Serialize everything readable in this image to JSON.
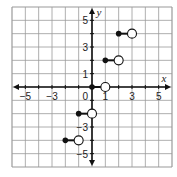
{
  "chart_data": {
    "type": "scatter",
    "title": "",
    "xlabel": "x",
    "ylabel": "y",
    "xlim": [
      -6,
      6
    ],
    "ylim": [
      -6,
      6
    ],
    "grid": true,
    "x_tick_labels": [
      {
        "value": -5,
        "label": "−5"
      },
      {
        "value": -3,
        "label": "−3"
      },
      {
        "value": 1,
        "label": "1"
      },
      {
        "value": 3,
        "label": "3"
      },
      {
        "value": 5,
        "label": "5"
      }
    ],
    "y_tick_labels": [
      {
        "value": 5,
        "label": "5"
      },
      {
        "value": 3,
        "label": "3"
      },
      {
        "value": 1,
        "label": "1"
      },
      {
        "value": -3,
        "label": "−3"
      },
      {
        "value": -5,
        "label": "−5"
      }
    ],
    "origin_label": "0",
    "segments": [
      {
        "closed": [
          2,
          4
        ],
        "open": [
          3,
          4
        ]
      },
      {
        "closed": [
          1,
          2
        ],
        "open": [
          2,
          2
        ]
      },
      {
        "closed": [
          0,
          0
        ],
        "open": [
          1,
          0
        ]
      },
      {
        "closed": [
          -1,
          -2
        ],
        "open": [
          0,
          -2
        ]
      },
      {
        "closed": [
          -2,
          -4
        ],
        "open": [
          -1,
          -4
        ]
      }
    ]
  },
  "colors": {
    "grid": "#9a9a9a",
    "axis": "#111111",
    "point": "#111111",
    "background": "#ffffff"
  }
}
